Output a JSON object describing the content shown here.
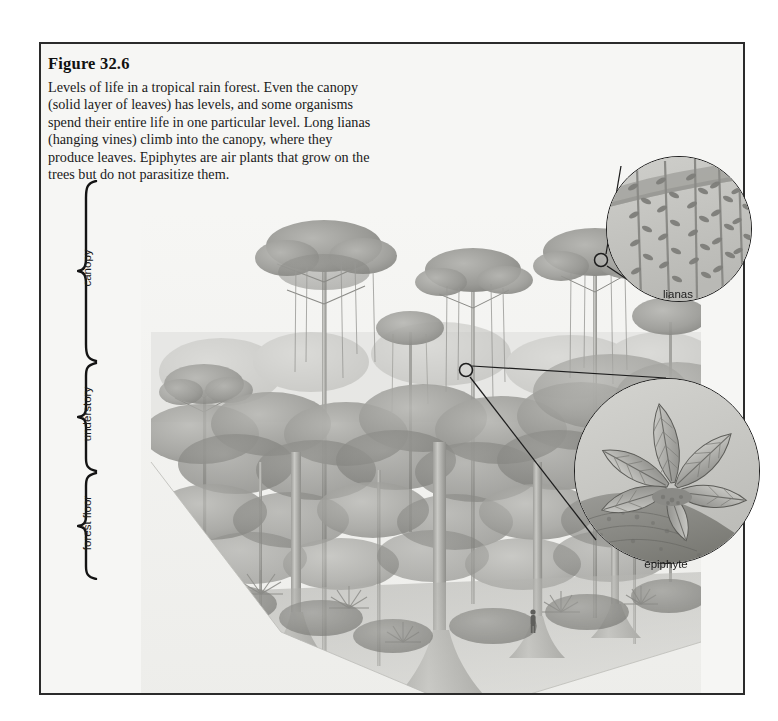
{
  "figure": {
    "title": "Figure 32.6",
    "caption": "Levels of life in a tropical rain forest. Even the canopy (solid layer of leaves) has levels, and some organisms spend their entire life in one particular level. Long lianas (hanging vines) climb into the canopy, where they produce leaves. Epiphytes are air plants that grow on the trees but do not parasitize them.",
    "border_color": "#2b2b2b",
    "background_color": "#f6f6f4"
  },
  "levels": [
    {
      "id": "canopy",
      "label": "canopy",
      "brace_top": 178,
      "brace_bottom": 360
    },
    {
      "id": "understory",
      "label": "understory",
      "brace_top": 360,
      "brace_bottom": 470
    },
    {
      "id": "forest-floor",
      "label": "forest floor",
      "brace_top": 470,
      "brace_bottom": 578
    }
  ],
  "callouts": [
    {
      "id": "lianas",
      "label": "lianas",
      "marker_x": 601,
      "marker_y": 260,
      "circle_cx": 678,
      "circle_cy": 228,
      "circle_r": 72,
      "label_x": 678,
      "label_y": 296
    },
    {
      "id": "epiphyte",
      "label": "epiphyte",
      "marker_x": 466,
      "marker_y": 370,
      "circle_cx": 666,
      "circle_cy": 470,
      "circle_r": 92,
      "label_x": 666,
      "label_y": 566
    }
  ],
  "illustration": {
    "description": "Grayscale illustration of a tropical rain forest block showing emergent trees, canopy layer, understory and forest floor with a small human figure for scale",
    "ink_color": "#8d8d8a",
    "accent_color": "#6f6f6c",
    "pale_color": "#c6c6c2"
  }
}
